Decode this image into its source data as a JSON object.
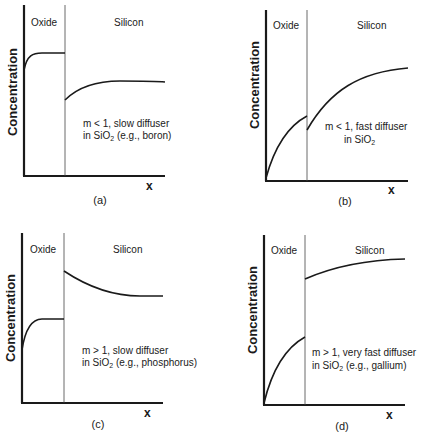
{
  "figure": {
    "panels": [
      {
        "id": "a",
        "caption": "(a)",
        "ylabel": "Concentration",
        "xlabel": "x",
        "region_left": "Oxide",
        "region_right": "Silicon",
        "note_line1": "m < 1, slow diffuser",
        "note_line2_pre": "in SiO",
        "note_line2_sub": "2",
        "note_line2_post": " (e.g., boron)"
      },
      {
        "id": "b",
        "caption": "(b)",
        "ylabel": "Concentration",
        "xlabel": "x",
        "region_left": "Oxide",
        "region_right": "Silicon",
        "note_line1": "m < 1, fast diffuser",
        "note_line2_pre": "in SiO",
        "note_line2_sub": "2",
        "note_line2_post": ""
      },
      {
        "id": "c",
        "caption": "(c)",
        "ylabel": "Concentration",
        "xlabel": "x",
        "region_left": "Oxide",
        "region_right": "Silicon",
        "note_line1": "m > 1, slow diffuser",
        "note_line2_pre": "in SiO",
        "note_line2_sub": "2",
        "note_line2_post": " (e.g., phosphorus)"
      },
      {
        "id": "d",
        "caption": "(d)",
        "ylabel": "Concentration",
        "xlabel": "x",
        "region_left": "Oxide",
        "region_right": "Silicon",
        "note_line1": "m > 1, very fast diffuser",
        "note_line2_pre": "in SiO",
        "note_line2_sub": "2",
        "note_line2_post": " (e.g., gallium)"
      }
    ]
  },
  "colors": {
    "ink": "#1a1a1a",
    "background": "#ffffff"
  }
}
